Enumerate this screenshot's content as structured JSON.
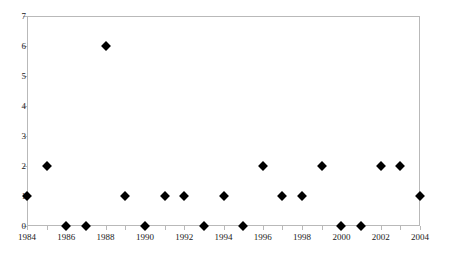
{
  "chart_data": {
    "type": "scatter",
    "title": "",
    "subtitle": "",
    "xlabel": "",
    "ylabel": "",
    "xlim": [
      1984,
      2004
    ],
    "ylim": [
      0,
      7
    ],
    "grid": false,
    "legend": null,
    "marker": {
      "shape": "diamond",
      "color": "#000000",
      "size": 7
    },
    "frame_color": "#b9b9b9",
    "x_tick_labels": [
      "1984",
      "1986",
      "1988",
      "1990",
      "1992",
      "1994",
      "1996",
      "1998",
      "2000",
      "2002",
      "2004"
    ],
    "x_tick_values": [
      1984,
      1986,
      1988,
      1990,
      1992,
      1994,
      1996,
      1998,
      2000,
      2002,
      2004
    ],
    "x_minor_tick_values": [
      1985,
      1987,
      1989,
      1991,
      1993,
      1995,
      1997,
      1999,
      2001,
      2003
    ],
    "y_tick_labels": [
      "0",
      "1",
      "2",
      "3",
      "4",
      "5",
      "6",
      "7"
    ],
    "y_tick_values": [
      0,
      1,
      2,
      3,
      4,
      5,
      6,
      7
    ],
    "x": [
      1984,
      1985,
      1986,
      1987,
      1988,
      1989,
      1990,
      1991,
      1992,
      1993,
      1994,
      1995,
      1996,
      1997,
      1998,
      1999,
      2000,
      2001,
      2002,
      2003,
      2004
    ],
    "values": [
      1,
      2,
      0,
      0,
      6,
      1,
      0,
      1,
      1,
      0,
      1,
      0,
      2,
      1,
      1,
      2,
      0,
      0,
      2,
      2,
      1
    ],
    "points": [
      {
        "x": 1984,
        "y": 1
      },
      {
        "x": 1985,
        "y": 2
      },
      {
        "x": 1986,
        "y": 0
      },
      {
        "x": 1987,
        "y": 0
      },
      {
        "x": 1988,
        "y": 6
      },
      {
        "x": 1989,
        "y": 1
      },
      {
        "x": 1990,
        "y": 0
      },
      {
        "x": 1991,
        "y": 1
      },
      {
        "x": 1992,
        "y": 1
      },
      {
        "x": 1993,
        "y": 0
      },
      {
        "x": 1994,
        "y": 1
      },
      {
        "x": 1995,
        "y": 0
      },
      {
        "x": 1996,
        "y": 2
      },
      {
        "x": 1997,
        "y": 1
      },
      {
        "x": 1998,
        "y": 1
      },
      {
        "x": 1999,
        "y": 2
      },
      {
        "x": 2000,
        "y": 0
      },
      {
        "x": 2001,
        "y": 0
      },
      {
        "x": 2002,
        "y": 2
      },
      {
        "x": 2003,
        "y": 2
      },
      {
        "x": 2004,
        "y": 1
      }
    ]
  }
}
